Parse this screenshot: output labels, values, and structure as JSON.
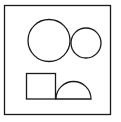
{
  "diagram": {
    "background": "#ffffff",
    "stroke": "#1a1a1a",
    "frame": {
      "x": 4.5,
      "y": 5.5,
      "width": 106,
      "height": 109
    },
    "shapes": {
      "large_circle": {
        "cx": 49,
        "cy": 40.5,
        "r": 21
      },
      "small_circle": {
        "cx": 86,
        "cy": 43,
        "r": 15
      },
      "square": {
        "x": 26.5,
        "y": 73.5,
        "width": 29,
        "height": 25.5
      },
      "half_circle": {
        "cx": 73.5,
        "cy": 99,
        "r": 17.5
      }
    }
  }
}
